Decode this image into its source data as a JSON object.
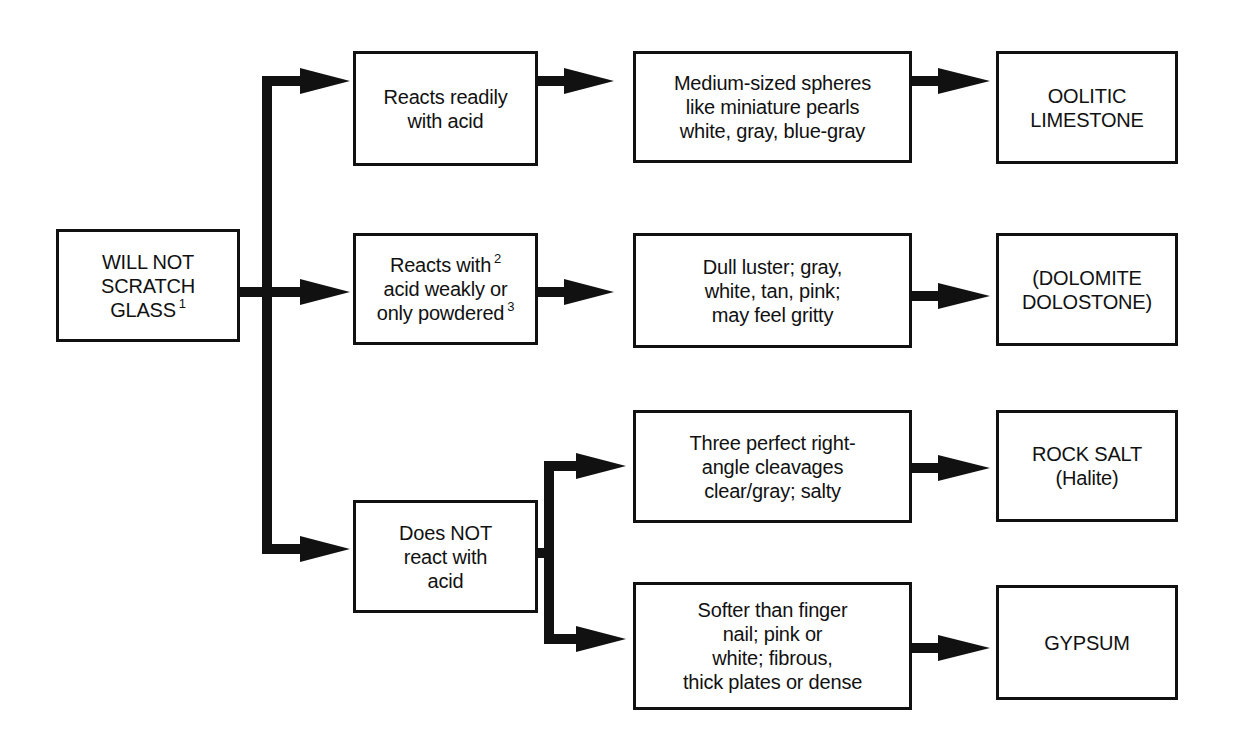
{
  "diagram": {
    "type": "flowchart",
    "title": "",
    "root": {
      "id": "root",
      "lines": [
        "WILL NOT",
        "SCRATCH",
        "GLASS"
      ],
      "footnote": "1"
    },
    "branches": [
      {
        "id": "reacts-readily",
        "test": {
          "lines": [
            "Reacts readily",
            "with acid"
          ]
        },
        "outcomes": [
          {
            "description": {
              "lines": [
                "Medium-sized spheres",
                "like miniature pearls",
                "white, gray, blue-gray"
              ]
            },
            "result": {
              "lines": [
                "OOLITIC",
                "LIMESTONE"
              ]
            }
          }
        ]
      },
      {
        "id": "reacts-weakly",
        "test": {
          "lines": [
            "Reacts with",
            "acid weakly or",
            "only powdered"
          ],
          "footnotes": [
            "2",
            "3"
          ]
        },
        "outcomes": [
          {
            "description": {
              "lines": [
                "Dull luster;  gray,",
                "white, tan, pink;",
                "may feel gritty"
              ]
            },
            "result": {
              "lines": [
                "(DOLOMITE",
                "DOLOSTONE)"
              ]
            }
          }
        ]
      },
      {
        "id": "no-reaction",
        "test": {
          "lines": [
            "Does NOT",
            "react with",
            "acid"
          ]
        },
        "outcomes": [
          {
            "description": {
              "lines": [
                "Three perfect right-",
                "angle cleavages",
                "clear/gray;  salty"
              ]
            },
            "result": {
              "lines": [
                "ROCK SALT",
                "(Halite)"
              ]
            }
          },
          {
            "description": {
              "lines": [
                "Softer than finger",
                "nail;  pink or",
                "white;  fibrous,",
                "thick plates or dense"
              ]
            },
            "result": {
              "lines": [
                "GYPSUM"
              ]
            }
          }
        ]
      }
    ],
    "colors": {
      "line": "#111111",
      "background": "#ffffff"
    }
  }
}
